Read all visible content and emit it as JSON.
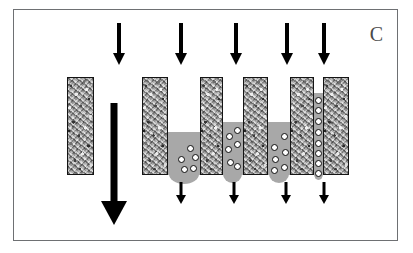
{
  "figure": {
    "panel_label": "C",
    "width": 413,
    "height": 253,
    "background": "#ffffff",
    "frame_color": "#6e7073",
    "block_border_color": "#141414",
    "block_fill_color": "#b9b9b9",
    "fluid_color": "#a8a8a8",
    "particle_fill": "#ffffff",
    "particle_border": "#0d0d0d",
    "arrow_color": "#000000",
    "caption": "Schematic of suspension flow through progressively narrowing gaps between porous blocks showing particle accumulation and bridging"
  },
  "arrows": {
    "inlet_label": "inlet-flow-arrow",
    "outlet_label": "outlet-flow-arrow",
    "bulk_label": "bulk-flow-arrow",
    "top": [
      {
        "name": "inlet-arrow-0",
        "x": 118,
        "y": 22,
        "length": 42,
        "shaft_width": 4,
        "head_width": 13,
        "head_height": 12
      },
      {
        "name": "inlet-arrow-1",
        "x": 180,
        "y": 22,
        "length": 42,
        "shaft_width": 4,
        "head_width": 13,
        "head_height": 12
      },
      {
        "name": "inlet-arrow-2",
        "x": 235,
        "y": 22,
        "length": 42,
        "shaft_width": 4,
        "head_width": 13,
        "head_height": 12
      },
      {
        "name": "inlet-arrow-3",
        "x": 286,
        "y": 22,
        "length": 42,
        "shaft_width": 4,
        "head_width": 13,
        "head_height": 12
      },
      {
        "name": "inlet-arrow-4",
        "x": 323,
        "y": 22,
        "length": 42,
        "shaft_width": 4,
        "head_width": 13,
        "head_height": 12
      }
    ],
    "bottom": [
      {
        "name": "outlet-arrow-0",
        "x": 180,
        "y": 181,
        "length": 22,
        "shaft_width": 3,
        "head_width": 10,
        "head_height": 9
      },
      {
        "name": "outlet-arrow-1",
        "x": 233,
        "y": 181,
        "length": 22,
        "shaft_width": 3,
        "head_width": 10,
        "head_height": 9
      },
      {
        "name": "outlet-arrow-2",
        "x": 285,
        "y": 181,
        "length": 22,
        "shaft_width": 3,
        "head_width": 10,
        "head_height": 9
      },
      {
        "name": "outlet-arrow-3",
        "x": 323,
        "y": 181,
        "length": 22,
        "shaft_width": 3,
        "head_width": 10,
        "head_height": 9
      }
    ],
    "bulk": {
      "name": "bulk-flow-arrow",
      "x": 113,
      "y": 102,
      "length": 122,
      "shaft_width": 7,
      "head_width": 26,
      "head_height": 24
    }
  },
  "blocks": [
    {
      "name": "porous-block-reference",
      "x": 66,
      "y": 76,
      "width": 27,
      "height": 98
    },
    {
      "name": "porous-block-1",
      "x": 141,
      "y": 76,
      "width": 26,
      "height": 98
    },
    {
      "name": "porous-block-2",
      "x": 199,
      "y": 76,
      "width": 23,
      "height": 98
    },
    {
      "name": "porous-block-3",
      "x": 242,
      "y": 76,
      "width": 25,
      "height": 98
    },
    {
      "name": "porous-block-4",
      "x": 289,
      "y": 76,
      "width": 24,
      "height": 98
    },
    {
      "name": "porous-block-5",
      "x": 322,
      "y": 76,
      "width": 26,
      "height": 98
    }
  ],
  "pools": [
    {
      "name": "fluid-pool-1",
      "x": 167,
      "y": 131,
      "width": 32,
      "height": 43,
      "lobe_width": 30,
      "lobe_height": 10,
      "lobe_x": 168
    },
    {
      "name": "fluid-pool-2",
      "x": 222,
      "y": 121,
      "width": 20,
      "height": 53,
      "lobe_width": 19,
      "lobe_height": 9,
      "lobe_x": 222
    },
    {
      "name": "fluid-pool-3",
      "x": 267,
      "y": 121,
      "width": 22,
      "height": 53,
      "lobe_width": 20,
      "lobe_height": 9,
      "lobe_x": 268
    },
    {
      "name": "fluid-pool-4",
      "x": 313,
      "y": 92,
      "width": 9,
      "height": 82,
      "lobe_width": 9,
      "lobe_height": 6,
      "lobe_x": 313
    }
  ],
  "pool_bridge": {
    "name": "fluid-bridge-span",
    "x": 222,
    "y": 121,
    "width": 67,
    "height": 10
  },
  "particles": {
    "gap_1": [
      {
        "x": 177,
        "y": 155
      },
      {
        "x": 186,
        "y": 144
      },
      {
        "x": 191,
        "y": 153
      },
      {
        "x": 180,
        "y": 165
      },
      {
        "x": 189,
        "y": 164
      }
    ],
    "gap_2": [
      {
        "x": 225,
        "y": 132
      },
      {
        "x": 233,
        "y": 126
      },
      {
        "x": 224,
        "y": 145
      },
      {
        "x": 233,
        "y": 140
      },
      {
        "x": 226,
        "y": 158
      },
      {
        "x": 233,
        "y": 162
      }
    ],
    "gap_3": [
      {
        "x": 270,
        "y": 143
      },
      {
        "x": 280,
        "y": 132
      },
      {
        "x": 271,
        "y": 155
      },
      {
        "x": 281,
        "y": 148
      },
      {
        "x": 270,
        "y": 166
      },
      {
        "x": 280,
        "y": 163
      }
    ],
    "gap_4": [
      {
        "x": 314,
        "y": 96
      },
      {
        "x": 314,
        "y": 106
      },
      {
        "x": 314,
        "y": 117
      },
      {
        "x": 314,
        "y": 128
      },
      {
        "x": 314,
        "y": 139
      },
      {
        "x": 314,
        "y": 149
      },
      {
        "x": 314,
        "y": 159
      },
      {
        "x": 314,
        "y": 169
      }
    ]
  }
}
